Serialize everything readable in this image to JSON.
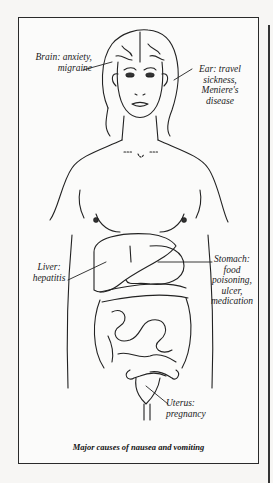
{
  "figure": {
    "caption": "Major causes of nausea and vomiting",
    "labels": {
      "brain": {
        "line1": "Brain: anxiety,",
        "line2": "migraine"
      },
      "ear": {
        "line1": "Ear: travel",
        "line2": "sickness,",
        "line3": "Meniere's",
        "line4": "disease"
      },
      "liver": {
        "line1": "Liver:",
        "line2": "hepatitis"
      },
      "stomach": {
        "line1": "Stomach:",
        "line2": "food",
        "line3": "poisoning,",
        "line4": "ulcer,",
        "line5": "medication"
      },
      "uterus": {
        "line1": "Uterus:",
        "line2": "pregnancy"
      }
    }
  }
}
